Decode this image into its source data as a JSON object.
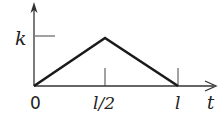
{
  "diagram": {
    "type": "triangular-pulse-graph",
    "y_axis_label": "k",
    "x_axis_label": "t",
    "tick_labels": {
      "origin": "0",
      "mid": "l/2",
      "end": "l"
    },
    "points": [
      {
        "t": "0",
        "value": "0"
      },
      {
        "t": "l/2",
        "value": "k"
      },
      {
        "t": "l",
        "value": "0"
      }
    ],
    "colors": {
      "line": "#1a1a1a",
      "axis": "#333333",
      "background": "#ffffff"
    }
  }
}
